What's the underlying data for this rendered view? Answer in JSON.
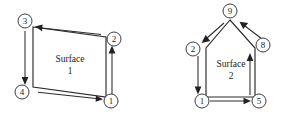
{
  "figure": {
    "background_color": "#ffffff",
    "stroke_color": "#2a2a2a",
    "label_color": "#1c1c1c",
    "width": 288,
    "height": 117
  },
  "surfaces": [
    {
      "id": "surface-1",
      "name_line1": "Surface",
      "name_line2": "1",
      "shape": "quadrilateral",
      "label_x": 70,
      "label_y": 61,
      "outline_points": "33,27 106,37 106,97 33,87",
      "nodes": [
        {
          "id": "node-3",
          "label": "3",
          "cx": 25,
          "cy": 21,
          "r": 7.0
        },
        {
          "id": "node-2",
          "label": "2",
          "cx": 114,
          "cy": 39,
          "r": 7.0
        },
        {
          "id": "node-1",
          "label": "1",
          "cx": 111,
          "cy": 101,
          "r": 7.0
        },
        {
          "id": "node-4",
          "label": "4",
          "cx": 22,
          "cy": 92,
          "r": 7.0
        }
      ],
      "edge_arrows": [
        {
          "id": "edge-arrow-bottom-1",
          "direction": "right",
          "from_x": 38,
          "from_y": 92,
          "to_x": 101,
          "to_y": 99
        },
        {
          "id": "edge-arrow-right-2",
          "direction": "up",
          "from_x": 112,
          "from_y": 94,
          "to_x": 112,
          "to_y": 48
        },
        {
          "id": "edge-arrow-top-3",
          "direction": "left",
          "from_x": 101,
          "from_y": 34,
          "to_x": 36,
          "to_y": 26
        },
        {
          "id": "edge-arrow-left-4",
          "direction": "down",
          "from_x": 25,
          "from_y": 31,
          "to_x": 25,
          "to_y": 82
        }
      ]
    },
    {
      "id": "surface-2",
      "name_line1": "Surface",
      "name_line2": "2",
      "shape": "pentagon-house",
      "label_x": 231,
      "label_y": 66,
      "outline_points": "230,20 255,48 255,97 206,97 206,48",
      "nodes": [
        {
          "id": "node-9",
          "label": "9",
          "cx": 230,
          "cy": 11,
          "r": 7.0
        },
        {
          "id": "node-8",
          "label": "8",
          "cx": 263,
          "cy": 45,
          "r": 7.0
        },
        {
          "id": "node-5",
          "label": "5",
          "cx": 259,
          "cy": 101,
          "r": 7.0
        },
        {
          "id": "node-1b",
          "label": "1",
          "cx": 202,
          "cy": 101,
          "r": 7.0
        },
        {
          "id": "node-2b",
          "label": "2",
          "cx": 193,
          "cy": 49,
          "r": 7.0
        }
      ],
      "edge_arrows": [
        {
          "id": "edge-arrow-bottom-1b",
          "direction": "right",
          "from_x": 209,
          "from_y": 101,
          "to_x": 250,
          "to_y": 101
        },
        {
          "id": "edge-arrow-right-5",
          "direction": "up",
          "from_x": 250,
          "from_y": 95,
          "to_x": 250,
          "to_y": 55
        },
        {
          "id": "edge-arrow-roof-right-8",
          "direction": "up-left",
          "from_x": 262,
          "from_y": 38,
          "to_x": 240,
          "to_y": 21
        },
        {
          "id": "edge-arrow-roof-left-9",
          "direction": "down-left",
          "from_x": 223,
          "from_y": 22,
          "to_x": 200,
          "to_y": 43
        },
        {
          "id": "edge-arrow-left-2b",
          "direction": "down",
          "from_x": 198,
          "from_y": 54,
          "to_x": 198,
          "to_y": 94
        }
      ]
    }
  ]
}
